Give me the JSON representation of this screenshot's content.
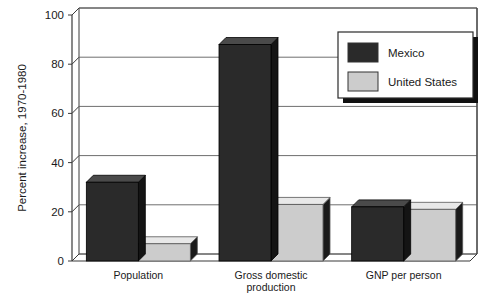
{
  "chart_data": {
    "type": "bar",
    "title": "",
    "subtitle": "",
    "xlabel": "",
    "ylabel": "Percent increase, 1970-1980",
    "categories": [
      "Population",
      "Gross domestic production",
      "GNP per person"
    ],
    "category_lines": [
      [
        "Population"
      ],
      [
        "Gross domestic",
        "production"
      ],
      [
        "GNP per person"
      ]
    ],
    "series": [
      {
        "name": "Mexico",
        "values": [
          32,
          88,
          22
        ],
        "color": "#2a2a2a"
      },
      {
        "name": "United States",
        "values": [
          7,
          23,
          21
        ],
        "color": "#cccccc"
      }
    ],
    "ylim": [
      0,
      100
    ],
    "yticks": [
      0,
      20,
      40,
      60,
      80,
      100
    ],
    "ytick_labels": [
      "0",
      "20",
      "40",
      "60",
      "80",
      "100"
    ],
    "grid": true,
    "grid_axis": "y",
    "legend_position": "top-right",
    "legend_entries": [
      {
        "label": "Mexico",
        "swatch_color": "#2a2a2a"
      },
      {
        "label": "United States",
        "swatch_color": "#cccccc"
      }
    ],
    "style": {
      "three_d": true,
      "depth_x": 7,
      "depth_y": 7,
      "axis_color": "#3a3a3a",
      "grid_color": "#6e6e6e",
      "background": "#ffffff",
      "mexico_top_face": "#4a4a4a",
      "mexico_side_face": "#141414",
      "us_top_face": "#e8e8e8",
      "us_side_face": "#1a1a1a"
    }
  }
}
